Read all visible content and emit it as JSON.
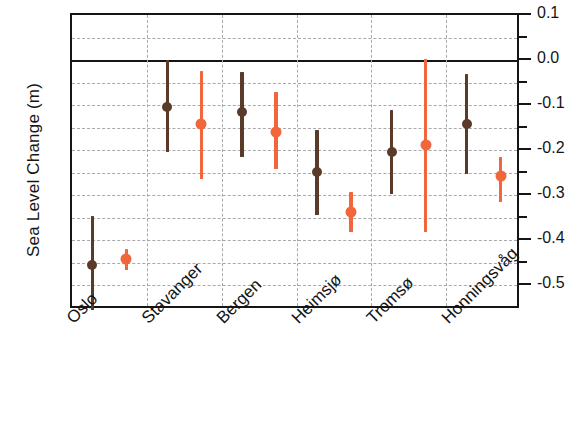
{
  "chart_data": {
    "type": "scatter",
    "title": "",
    "xlabel": "",
    "ylabel": "Sea Level Change (m)",
    "ylim": [
      -0.56,
      0.1
    ],
    "yticks_major": [
      0.1,
      0.0,
      -0.1,
      -0.2,
      -0.3,
      -0.4,
      -0.5
    ],
    "ytick_labels": [
      "0.1",
      "0.0",
      "-0.1",
      "-0.2",
      "-0.3",
      "-0.4",
      "-0.5"
    ],
    "yticks_minor": [
      0.05,
      -0.05,
      -0.15,
      -0.25,
      -0.35,
      -0.45
    ],
    "grid": "dashed-both",
    "legend": "none",
    "categories": [
      "Oslo",
      "Stavanger",
      "Bergen",
      "Heimsjø",
      "Tromsø",
      "Honningsvåg"
    ],
    "series": [
      {
        "name": "series-1",
        "color": "#5a3a28",
        "marker": "circle",
        "values": [
          -0.456,
          -0.104,
          -0.116,
          -0.249,
          -0.204,
          -0.142
        ],
        "error_low": [
          -0.556,
          -0.204,
          -0.216,
          -0.344,
          -0.298,
          -0.253
        ],
        "error_high": [
          -0.347,
          0.0,
          -0.027,
          -0.156,
          -0.111,
          -0.031
        ]
      },
      {
        "name": "series-2",
        "color": "#f2663c",
        "marker": "circle",
        "values": [
          -0.442,
          -0.142,
          -0.16,
          -0.338,
          -0.189,
          -0.258
        ],
        "error_low": [
          -0.467,
          -0.264,
          -0.242,
          -0.382,
          -0.382,
          -0.316
        ],
        "error_high": [
          -0.42,
          -0.024,
          -0.071,
          -0.293,
          0.002,
          -0.216
        ]
      }
    ]
  },
  "axes": {
    "y_title": "Sea Level Change (m)",
    "frame_color": "#151515",
    "grid_color": "#a9a9ad"
  },
  "colors": {
    "series_1": "#5a3a28",
    "series_2": "#f2663c",
    "background": "#ffffff",
    "text": "#141414"
  }
}
